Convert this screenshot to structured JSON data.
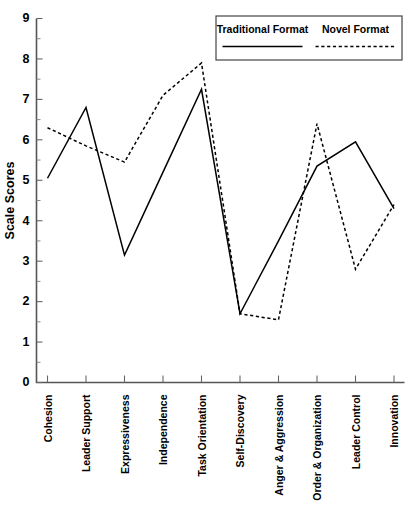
{
  "chart_data": {
    "type": "line",
    "title": "",
    "xlabel": "",
    "ylabel": "Scale Scores",
    "ylim": [
      0,
      9
    ],
    "yticks": [
      0,
      1,
      2,
      3,
      4,
      5,
      6,
      7,
      8,
      9
    ],
    "ytick_labels": [
      "0",
      "1",
      "2",
      "3",
      "4",
      "5",
      "6",
      "7",
      "8",
      "9"
    ],
    "grid": false,
    "legend_position": "top-right",
    "categories": [
      "Cohesion",
      "Leader Support",
      "Expressiveness",
      "Independence",
      "Task Orientation",
      "Self-Discovery",
      "Anger & Aggression",
      "Order & Organization",
      "Leader Control",
      "Innovation"
    ],
    "series": [
      {
        "name": "Traditional Format",
        "style": "solid",
        "color": "#000000",
        "values": [
          5.05,
          6.8,
          3.15,
          5.2,
          7.25,
          1.7,
          3.5,
          5.35,
          5.95,
          4.3
        ]
      },
      {
        "name": "Novel Format",
        "style": "dashed",
        "color": "#000000",
        "values": [
          6.3,
          5.85,
          5.45,
          7.1,
          7.9,
          1.7,
          1.55,
          6.4,
          2.8,
          4.4
        ]
      }
    ]
  },
  "legend": {
    "entries": [
      {
        "label": "Traditional Format",
        "style": "solid"
      },
      {
        "label": "Novel Format",
        "style": "dashed"
      }
    ]
  },
  "axis": {
    "y_title": "Scale Scores"
  }
}
